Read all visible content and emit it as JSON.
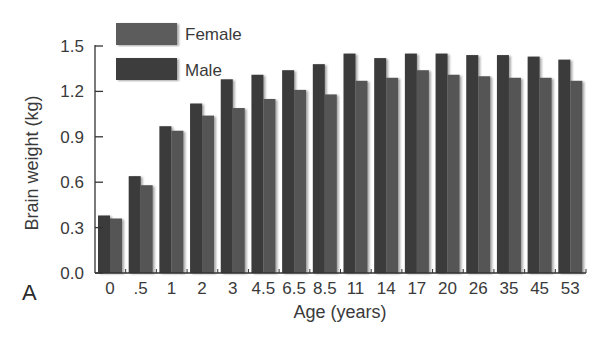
{
  "panel_label": "A",
  "legend": {
    "female_label": "Female",
    "male_label": "Male"
  },
  "colors": {
    "male": "#3a3a3a",
    "female": "#545454",
    "legend_female": "#5c5c5c",
    "legend_male": "#3e3e3e",
    "axis": "#333333"
  },
  "chart_data": {
    "type": "bar",
    "title": "",
    "xlabel": "Age (years)",
    "ylabel": "Brain weight (kg)",
    "ylim": [
      0,
      1.5
    ],
    "yticks": [
      "0.0",
      "0.3",
      "0.6",
      "0.9",
      "1.2",
      "1.5"
    ],
    "grid": false,
    "legend_position": "top-left",
    "categories": [
      "0",
      ".5",
      "1",
      "2",
      "3",
      "4.5",
      "6.5",
      "8.5",
      "11",
      "14",
      "17",
      "20",
      "26",
      "35",
      "45",
      "53"
    ],
    "series": [
      {
        "name": "Male",
        "values": [
          0.38,
          0.64,
          0.97,
          1.12,
          1.28,
          1.31,
          1.34,
          1.38,
          1.45,
          1.42,
          1.45,
          1.45,
          1.44,
          1.44,
          1.43,
          1.41
        ]
      },
      {
        "name": "Female",
        "values": [
          0.36,
          0.58,
          0.94,
          1.04,
          1.09,
          1.15,
          1.21,
          1.18,
          1.27,
          1.29,
          1.34,
          1.31,
          1.3,
          1.29,
          1.29,
          1.27
        ]
      }
    ]
  }
}
